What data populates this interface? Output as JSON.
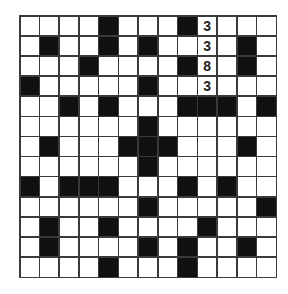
{
  "puzzle": {
    "type": "crossword",
    "rows": 13,
    "cols": 13,
    "colors": {
      "black": "#111111",
      "white": "#ffffff",
      "line": "#3a3a3a"
    },
    "grid": [
      "....#...#3...",
      ".#..#.#..3.#.",
      "...#....#8.#.",
      "#.....#..3...",
      "..#.#...###.#",
      "......#......",
      ".#...###...#.",
      "......#......",
      "#.###...#.#..",
      "......#.....#",
      ".#..#....#...",
      ".#....#.#..#.",
      "....#...#...."
    ],
    "filled_values": [
      {
        "row": 0,
        "col": 9,
        "value": "3"
      },
      {
        "row": 1,
        "col": 9,
        "value": "3"
      },
      {
        "row": 2,
        "col": 9,
        "value": "8"
      },
      {
        "row": 3,
        "col": 9,
        "value": "3"
      }
    ]
  }
}
